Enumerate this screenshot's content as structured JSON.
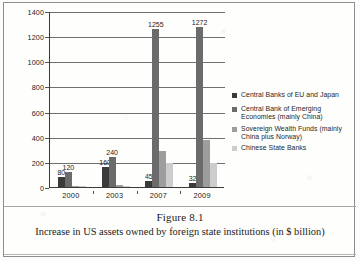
{
  "figure": {
    "caption_title": "Figure 8.1",
    "caption_subtitle": "Increase in US assets owned by foreign state institutions (in $ billion)"
  },
  "colors": {
    "series_1": "#3a3a3a",
    "series_2": "#6b6b6b",
    "series_3": "#9d9d9d",
    "series_4": "#cdcdcd",
    "axis": "#3a3a3a",
    "grid": "#6f6f6f",
    "text": "#1a1a1a",
    "page": "#fdfdfb"
  },
  "legend": {
    "position": "right",
    "items": [
      {
        "label": "Central Banks of EU and Japan",
        "color": "#3a3a3a"
      },
      {
        "label": "Central Bank of Emerging Economies (mainly China)",
        "color": "#6b6b6b"
      },
      {
        "label": "Sovereign Wealth Funds (mainly China plus Norway)",
        "color": "#9d9d9d"
      },
      {
        "label": "Chinese State Banks",
        "color": "#cdcdcd"
      }
    ]
  },
  "chart_data": {
    "type": "bar",
    "title": "Increase in US assets owned by foreign state institutions (in $ billion)",
    "xlabel": "",
    "ylabel": "",
    "ylim": [
      0,
      1400
    ],
    "yticks": [
      0,
      200,
      400,
      600,
      800,
      1000,
      1200,
      1400
    ],
    "grid": true,
    "categories": [
      "2000",
      "2003",
      "2007",
      "2009"
    ],
    "series": [
      {
        "name": "Central Banks of EU and Japan",
        "color": "#3a3a3a",
        "values": [
          80,
          160,
          45,
          32
        ],
        "labels": [
          "80",
          "160",
          "45",
          "32"
        ]
      },
      {
        "name": "Central Bank of Emerging Economies (mainly China)",
        "color": "#6b6b6b",
        "values": [
          120,
          240,
          1255,
          1272
        ],
        "labels": [
          "120",
          "240",
          "1255",
          "1272"
        ]
      },
      {
        "name": "Sovereign Wealth Funds (mainly China plus Norway)",
        "color": "#9d9d9d",
        "values": [
          10,
          20,
          290,
          375
        ],
        "labels": [
          "",
          "",
          "",
          ""
        ]
      },
      {
        "name": "Chinese State Banks",
        "color": "#cdcdcd",
        "values": [
          4,
          8,
          190,
          190
        ],
        "labels": [
          "",
          "",
          "",
          ""
        ]
      }
    ]
  },
  "yaxis_labels": [
    "1400",
    "1200",
    "1000",
    "800",
    "600",
    "400",
    "200",
    "0"
  ],
  "xaxis_labels": [
    "2000",
    "2003",
    "2007",
    "2009"
  ]
}
